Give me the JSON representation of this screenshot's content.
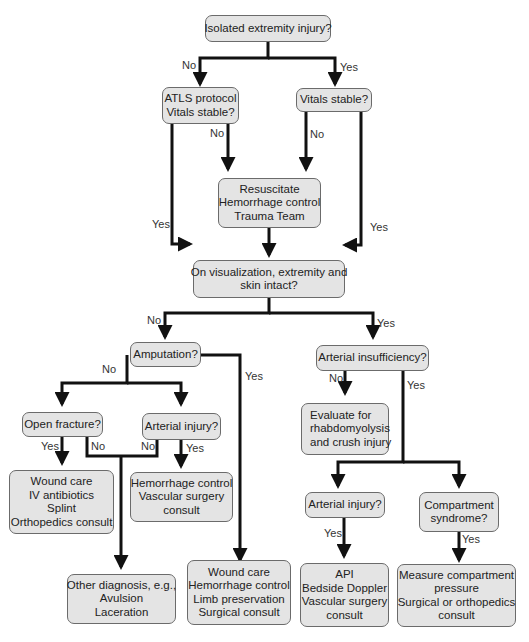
{
  "diagram": {
    "type": "flowchart",
    "colors": {
      "box_fill": "#e4e4e4",
      "box_border": "#6b6b6b",
      "line": "#111111",
      "text": "#222222"
    },
    "nodes": {
      "isolated": {
        "lines": [
          "Isolated extremity injury?"
        ]
      },
      "atls": {
        "lines": [
          "ATLS protocol",
          "Vitals stable?"
        ]
      },
      "vitals": {
        "lines": [
          "Vitals stable?"
        ]
      },
      "resus": {
        "lines": [
          "Resuscitate",
          "Hemorrhage control",
          "Trauma Team"
        ]
      },
      "visual": {
        "lines": [
          "On visualization, extremity and",
          "skin intact?"
        ]
      },
      "amputation": {
        "lines": [
          "Amputation?"
        ]
      },
      "art_insuff": {
        "lines": [
          "Arterial insufficiency?"
        ]
      },
      "open_fx": {
        "lines": [
          "Open fracture?"
        ]
      },
      "art_inj_l": {
        "lines": [
          "Arterial injury?"
        ]
      },
      "eval_rhabdo": {
        "lines": [
          "Evaluate for",
          "rhabdomyolysis",
          "and crush injury"
        ]
      },
      "wound_iv": {
        "lines": [
          "Wound care",
          "IV antibiotics",
          "Splint",
          "Orthopedics consult"
        ]
      },
      "hem_vasc": {
        "lines": [
          "Hemorrhage control",
          "Vascular surgery",
          "consult"
        ]
      },
      "art_inj_r": {
        "lines": [
          "Arterial injury?"
        ]
      },
      "compartment": {
        "lines": [
          "Compartment",
          "syndrome?"
        ]
      },
      "other_dx": {
        "lines": [
          "Other diagnosis, e.g.,",
          "Avulsion",
          "Laceration"
        ]
      },
      "wound_limb": {
        "lines": [
          "Wound care",
          "Hemorrhage control",
          "Limb preservation",
          "Surgical consult"
        ]
      },
      "api": {
        "lines": [
          "API",
          "Bedside Doppler",
          "Vascular surgery",
          "consult"
        ]
      },
      "measure": {
        "lines": [
          "Measure compartment",
          "pressure",
          "Surgical or orthopedics",
          "consult"
        ]
      }
    },
    "edge_labels": {
      "iso_no": "No",
      "iso_yes": "Yes",
      "atls_no": "No",
      "atls_yes": "Yes",
      "vit_no": "No",
      "vit_yes": "Yes",
      "vis_no": "No",
      "vis_yes": "Yes",
      "amp_no": "No",
      "amp_yes": "Yes",
      "ai_no": "No",
      "ai_yes": "Yes",
      "ofx_yes": "Yes",
      "ofx_no": "No",
      "ail_no": "No",
      "ail_yes": "Yes",
      "air_yes": "Yes",
      "cs_yes": "Yes"
    }
  }
}
